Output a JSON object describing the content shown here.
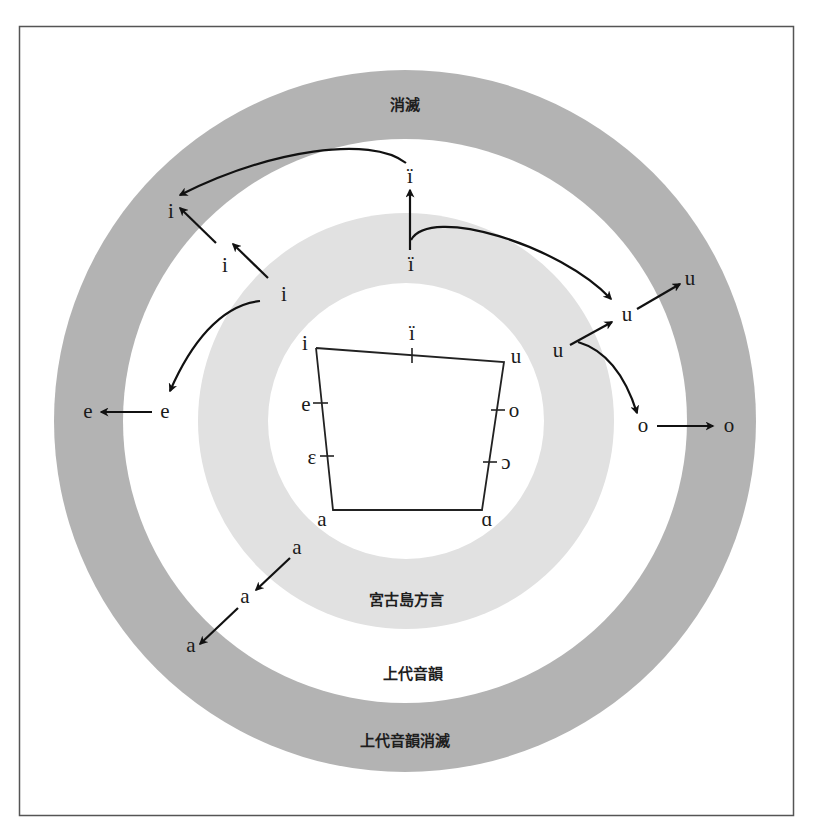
{
  "colors": {
    "outer_ring": "#b3b3b3",
    "middle_ring": "#ffffff",
    "inner_ring": "#e1e1e1",
    "core": "#ffffff",
    "frame": "#555555",
    "ink": "#111111"
  },
  "rings": {
    "outer_label": "上代音韻消滅",
    "outer_top_label": "消滅",
    "middle_label": "上代音韻",
    "inner_label": "宮古島方言"
  },
  "vowel_chart": {
    "corners": {
      "top_left": "i",
      "top_mid": "ï",
      "top_right": "u",
      "bottom_left": "a",
      "bottom_right": "ɑ"
    },
    "left_side": [
      "e",
      "ɛ"
    ],
    "right_side": [
      "o",
      "ɔ"
    ]
  },
  "nodes": {
    "i_inner": "i",
    "i_middle": "i",
    "i_outer": "i",
    "ii_inner": "ï",
    "ii_outer": "ï",
    "e_middle": "e",
    "e_outer": "e",
    "u_inner": "u",
    "u_middle": "u",
    "u_outer": "u",
    "o_middle": "o",
    "o_outer": "o",
    "a_inner": "a",
    "a_middle": "a",
    "a_outer": "a"
  }
}
